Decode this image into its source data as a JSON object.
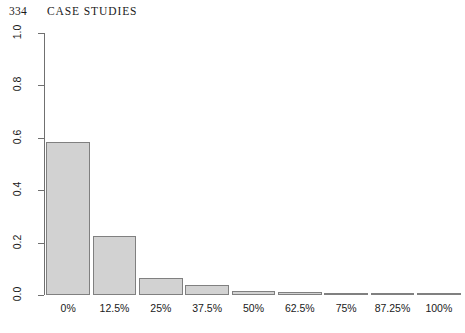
{
  "page": {
    "number": "334",
    "running_head": "CASE STUDIES"
  },
  "chart_data": {
    "type": "bar",
    "title": "",
    "subtitle": "",
    "xlabel": "",
    "ylabel": "",
    "categories": [
      "0%",
      "12.5%",
      "25%",
      "37.5%",
      "50%",
      "62.5%",
      "75%",
      "87.25%",
      "100%"
    ],
    "values": [
      0.585,
      0.225,
      0.065,
      0.038,
      0.016,
      0.01,
      0.005,
      0.002,
      0.001
    ],
    "ylim": [
      0.0,
      1.0
    ],
    "ytick_labels": [
      "0.0",
      "0.2",
      "0.4",
      "0.6",
      "0.8",
      "1.0"
    ],
    "ytick_values": [
      0.0,
      0.2,
      0.4,
      0.6,
      0.8,
      1.0
    ],
    "grid": false,
    "legend": "none",
    "bar_fill_color": "#d2d2d2",
    "bar_border_color": "#808080",
    "axis_color": "#707070",
    "text_color": "#1a1a1a",
    "background_color": "#ffffff"
  }
}
